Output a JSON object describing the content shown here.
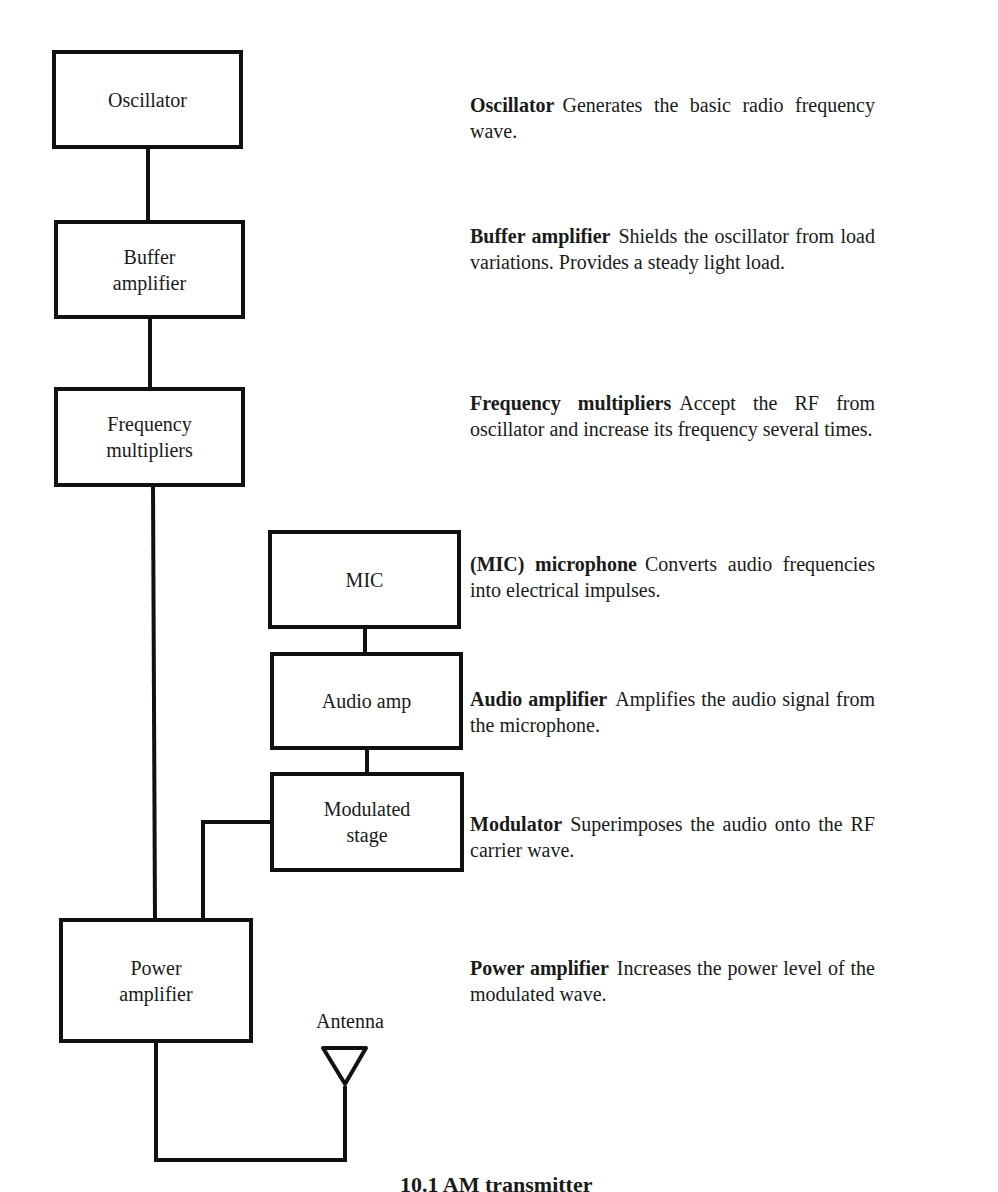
{
  "diagram": {
    "blocks": [
      {
        "id": "oscillator",
        "label": "Oscillator"
      },
      {
        "id": "buffer",
        "label": "Buffer\namplifier"
      },
      {
        "id": "freqmult",
        "label": "Frequency\nmultipliers"
      },
      {
        "id": "mic",
        "label": "MIC"
      },
      {
        "id": "audioamp",
        "label": "Audio amp"
      },
      {
        "id": "modstage",
        "label": "Modulated\nstage"
      },
      {
        "id": "poweramp",
        "label": "Power\namplifier"
      }
    ],
    "antenna_label": "Antenna",
    "connections": [
      [
        "oscillator",
        "buffer"
      ],
      [
        "buffer",
        "freqmult"
      ],
      [
        "freqmult",
        "poweramp"
      ],
      [
        "mic",
        "audioamp"
      ],
      [
        "audioamp",
        "modstage"
      ],
      [
        "modstage",
        "poweramp"
      ],
      [
        "poweramp",
        "antenna"
      ]
    ]
  },
  "descriptions": [
    {
      "term": "Oscillator",
      "text": "Generates the basic radio frequency wave."
    },
    {
      "term": "Buffer amplifier",
      "text": "Shields the oscillator from load variations. Provides a steady light load."
    },
    {
      "term": "Frequency multipliers",
      "text": "Accept the RF from oscillator and increase its frequency several times."
    },
    {
      "term": "(MIC) microphone",
      "text": "Converts audio frequencies into electrical impulses."
    },
    {
      "term": "Audio amplifier",
      "text": "Amplifies the audio signal from the microphone."
    },
    {
      "term": "Modulator",
      "text": "Superimposes the audio onto the RF carrier wave."
    },
    {
      "term": "Power amplifier",
      "text": "Increases the power level of the modulated wave."
    }
  ],
  "caption": "10.1 AM transmitter"
}
